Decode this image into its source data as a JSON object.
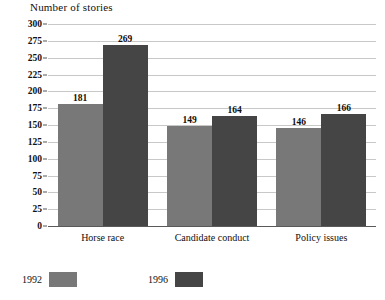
{
  "chart_data": {
    "type": "bar",
    "title": "Number of stories",
    "xlabel": "",
    "ylabel": "",
    "ylim": [
      0,
      300
    ],
    "ytick_step": 25,
    "yticks": [
      "0",
      "25",
      "50",
      "75",
      "100",
      "125",
      "150",
      "175",
      "200",
      "225",
      "250",
      "275",
      "300"
    ],
    "grid": true,
    "legend_position": "bottom-left",
    "categories": [
      "Horse race",
      "Candidate conduct",
      "Policy issues"
    ],
    "series": [
      {
        "name": "1992",
        "color": "#787878",
        "values": [
          181,
          149,
          146
        ]
      },
      {
        "name": "1996",
        "color": "#454545",
        "values": [
          269,
          164,
          166
        ]
      }
    ],
    "data_labels": [
      "181",
      "269",
      "149",
      "164",
      "146",
      "166"
    ]
  },
  "legend": {
    "items": [
      {
        "label": "1992"
      },
      {
        "label": "1996"
      }
    ]
  },
  "colors": {
    "series_1992": "#787878",
    "series_1996": "#454545",
    "gridline": "#c8c8c8",
    "axis": "#5a5a5a",
    "background": "#ffffff"
  }
}
